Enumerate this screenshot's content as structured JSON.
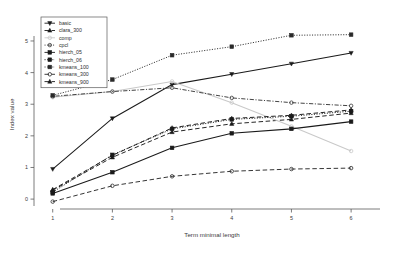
{
  "chart_data": {
    "type": "line",
    "title": "",
    "xlabel": "Term minimal length",
    "ylabel": "Index value",
    "x": [
      1,
      2,
      3,
      4,
      5,
      6
    ],
    "xtick_labels": [
      "1",
      "2",
      "3",
      "4",
      "5",
      "6"
    ],
    "ytick_labels": [
      "0",
      "1",
      "2",
      "3",
      "4",
      "5"
    ],
    "ytick_values": [
      0,
      1,
      2,
      3,
      4,
      5
    ],
    "xlim": [
      0.72,
      6.35
    ],
    "ylim": [
      -0.25,
      5.6
    ],
    "grid": false,
    "legend_position": "top-left",
    "series": [
      {
        "name": "basic",
        "values": [
          0.95,
          2.55,
          3.62,
          3.95,
          4.28,
          4.62
        ],
        "color": "#1a1a1a",
        "line_style": "solid",
        "marker": "triangle-down"
      },
      {
        "name": "clara_300",
        "values": [
          0.28,
          1.32,
          2.12,
          2.38,
          2.52,
          2.72
        ],
        "color": "#1a1a1a",
        "line_style": "dashed",
        "marker": "triangle-up"
      },
      {
        "name": "comp",
        "values": [
          3.22,
          3.4,
          3.72,
          3.05,
          2.3,
          1.52
        ],
        "color": "#c9c9c9",
        "line_style": "solid",
        "marker": "circle"
      },
      {
        "name": "cpcl",
        "values": [
          3.25,
          3.4,
          3.52,
          3.2,
          3.05,
          2.95
        ],
        "color": "#3a3a3a",
        "line_style": "dotdash",
        "marker": "circle"
      },
      {
        "name": "hierch_05",
        "values": [
          0.18,
          0.85,
          1.62,
          2.08,
          2.22,
          2.45
        ],
        "color": "#1a1a1a",
        "line_style": "solid",
        "marker": "square"
      },
      {
        "name": "hierch_06",
        "values": [
          0.22,
          1.4,
          2.22,
          2.52,
          2.62,
          2.78
        ],
        "color": "#1a1a1a",
        "line_style": "dotted",
        "marker": "square"
      },
      {
        "name": "kmeans_100",
        "values": [
          3.28,
          3.78,
          4.55,
          4.82,
          5.18,
          5.2
        ],
        "color": "#2a2a2a",
        "line_style": "dotted",
        "marker": "square"
      },
      {
        "name": "kmeans_300",
        "values": [
          -0.08,
          0.42,
          0.72,
          0.88,
          0.95,
          0.98
        ],
        "color": "#2a2a2a",
        "line_style": "dashed",
        "marker": "circle"
      },
      {
        "name": "kmeans_900",
        "values": [
          0.3,
          1.38,
          2.25,
          2.55,
          2.65,
          2.82
        ],
        "color": "#1a1a1a",
        "line_style": "dashed",
        "marker": "triangle-up"
      }
    ]
  },
  "legend": {
    "entries": [
      {
        "label": "basic"
      },
      {
        "label": "clara_300"
      },
      {
        "label": "comp"
      },
      {
        "label": "cpcl"
      },
      {
        "label": "hierch_05"
      },
      {
        "label": "hierch_06"
      },
      {
        "label": "kmeans_100"
      },
      {
        "label": "kmeans_300"
      },
      {
        "label": "kmeans_900"
      }
    ]
  }
}
